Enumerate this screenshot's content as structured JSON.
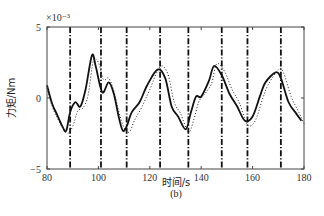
{
  "chart_data": {
    "type": "line",
    "title": "",
    "caption": "(b)",
    "xlabel": "时间/s",
    "ylabel": "力矩/Nm",
    "y_multiplier": "×10⁻³",
    "xlim": [
      80,
      180
    ],
    "ylim": [
      -5,
      5
    ],
    "xticks": [
      80,
      100,
      120,
      140,
      160,
      180
    ],
    "yticks": [
      5,
      0,
      -5
    ],
    "grid": false,
    "legend": null,
    "series": [
      {
        "name": "solid",
        "style": "solid",
        "color": "#111111",
        "x": [
          80,
          82,
          84,
          86,
          87.5,
          89,
          91,
          93,
          95,
          97.5,
          99,
          101.5,
          104,
          106,
          108,
          109.5,
          111,
          113,
          116,
          119,
          123,
          126,
          128.5,
          131,
          134,
          136,
          138,
          140,
          143,
          145,
          148,
          151,
          154,
          157,
          160,
          163,
          165,
          169,
          171,
          174,
          177,
          179
        ],
        "y": [
          0.9,
          -0.4,
          -1.2,
          -2.0,
          -2.3,
          -1.0,
          -0.3,
          -0.6,
          0.6,
          3.0,
          2.2,
          0.4,
          1.1,
          0.3,
          -1.4,
          -2.3,
          -2.0,
          -1.0,
          -0.3,
          0.9,
          2.0,
          1.4,
          -0.6,
          -1.3,
          -2.2,
          -1.0,
          0.1,
          0.1,
          1.2,
          2.25,
          1.6,
          0.3,
          -0.6,
          -1.6,
          -1.3,
          0.2,
          1.1,
          1.8,
          1.4,
          -0.3,
          -1.1,
          -1.6
        ]
      },
      {
        "name": "dotted",
        "style": "dotted",
        "color": "#222222",
        "x": [
          80,
          82,
          84,
          86,
          88,
          90,
          92,
          94,
          96,
          98,
          100,
          102,
          104,
          106,
          108,
          110,
          112,
          114,
          117,
          120,
          124,
          127,
          129.5,
          132,
          135,
          137,
          139,
          141,
          144,
          146,
          149,
          152,
          155,
          158,
          161,
          164,
          166,
          170,
          172,
          175,
          178,
          180
        ],
        "y": [
          0.7,
          -0.6,
          -1.4,
          -2.1,
          -2.5,
          -2.0,
          -0.9,
          -0.7,
          0.2,
          2.6,
          2.5,
          1.3,
          1.4,
          0.5,
          -1.0,
          -2.1,
          -2.4,
          -1.6,
          -0.6,
          0.6,
          2.2,
          1.7,
          -0.3,
          -1.1,
          -2.4,
          -1.6,
          -0.3,
          0.2,
          1.0,
          2.4,
          1.9,
          0.6,
          -0.4,
          -1.9,
          -1.6,
          0.0,
          0.9,
          2.0,
          1.8,
          0.1,
          -1.0,
          -1.8
        ]
      }
    ],
    "vertical_lines": {
      "style": "dash-dot",
      "color": "#111111",
      "x": [
        89,
        101,
        111,
        124,
        135,
        148,
        158,
        171
      ]
    }
  }
}
